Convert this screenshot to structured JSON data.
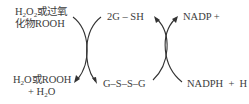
{
  "diagram": {
    "left_cycle": {
      "top_left": {
        "line1_parts": [
          "H",
          "2",
          "O",
          "2",
          "或过氧"
        ],
        "line2": "化物ROOH"
      },
      "bottom_left": {
        "line1_parts": [
          "H",
          "2",
          "O或ROOH"
        ],
        "line2_parts": [
          "+ H",
          "2",
          "O"
        ]
      }
    },
    "center": {
      "top": "2G – SH",
      "bottom": "G–S–S–G"
    },
    "right_cycle": {
      "top_right": "NADP +",
      "bottom_right": "NADPH  +  H"
    },
    "arrows": [
      {
        "name": "peroxide-to-water",
        "from": "top_left",
        "to": "bottom_left"
      },
      {
        "name": "gsh-to-gssg",
        "from": "center.top",
        "to": "center.bottom"
      },
      {
        "name": "gssg-to-gsh",
        "from": "center.bottom",
        "to": "center.top"
      },
      {
        "name": "nadph-to-nadp",
        "from": "bottom_right",
        "to": "top_right"
      }
    ]
  }
}
